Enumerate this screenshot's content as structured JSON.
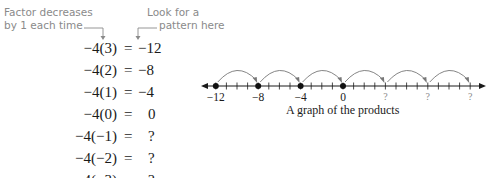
{
  "annotations": {
    "left_line1": "Factor decreases",
    "left_line2": "by 1 each time",
    "right_line1": "Look for a",
    "right_line2": "pattern here"
  },
  "equations": [
    {
      "lhs": "−4(3)",
      "sign": "=",
      "rhs": "−12"
    },
    {
      "lhs": "−4(2)",
      "sign": "=",
      "rhs": "−8"
    },
    {
      "lhs": "−4(1)",
      "sign": "=",
      "rhs": "−4"
    },
    {
      "lhs": "−4(0)",
      "sign": "=",
      "rhs": "0"
    },
    {
      "lhs": "−4(−1)",
      "sign": "=",
      "rhs": "?"
    },
    {
      "lhs": "−4(−2)",
      "sign": "=",
      "rhs": "?"
    },
    {
      "lhs": "−4(−3)",
      "sign": "=",
      "rhs": "?"
    }
  ],
  "number_line": {
    "labels": [
      {
        "text": "−12",
        "value": -12
      },
      {
        "text": "−8",
        "value": -8
      },
      {
        "text": "−4",
        "value": -4
      },
      {
        "text": "0",
        "value": 0
      },
      {
        "text": "?",
        "value": 4
      },
      {
        "text": "?",
        "value": 8
      },
      {
        "text": "?",
        "value": 12
      }
    ],
    "plotted_points": [
      -12,
      -8,
      -4,
      0
    ],
    "arcs": [
      [
        -12,
        -8
      ],
      [
        -8,
        -4
      ],
      [
        -4,
        0
      ],
      [
        0,
        4
      ],
      [
        4,
        8
      ],
      [
        8,
        12
      ]
    ],
    "caption": "A graph of the products"
  },
  "colors": {
    "annotation": "#8a8a8a",
    "text": "#1a1a1a",
    "arc": "#777777"
  }
}
